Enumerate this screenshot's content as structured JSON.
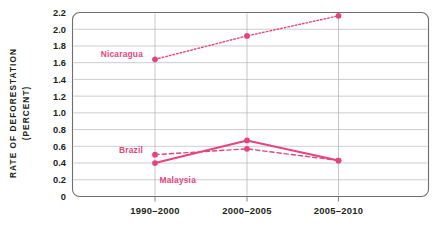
{
  "chart_data": {
    "type": "line",
    "title": "",
    "xlabel": "",
    "ylabel_line1": "RATE OF DEFORESTATION",
    "ylabel_line2": "(PERCENT)",
    "categories": [
      "1990–2000",
      "2000–2005",
      "2005–2010"
    ],
    "ylim": [
      0,
      2.2
    ],
    "ytick_values": [
      0,
      0.2,
      0.4,
      0.6,
      0.8,
      1.0,
      1.2,
      1.4,
      1.6,
      1.8,
      2.0,
      2.2
    ],
    "ytick_labels": [
      "0",
      "0.2",
      "0.4",
      "0.6",
      "0.8",
      "1.0",
      "1.2",
      "1.4",
      "1.6",
      "1.8",
      "2.0",
      "2.2"
    ],
    "grid": true,
    "legend_position": "inline-annotations",
    "series": [
      {
        "name": "Nicaragua",
        "values": [
          1.64,
          1.92,
          2.16
        ],
        "style": "dotted",
        "color": "#e5457f",
        "label_x_value": 0.62,
        "label_y_value": 1.7
      },
      {
        "name": "Brazil",
        "values": [
          0.5,
          0.57,
          0.43
        ],
        "style": "dashed",
        "color": "#e5457f",
        "label_x_value": 0.6,
        "label_y_value": 0.52
      },
      {
        "name": "Malaysia",
        "values": [
          0.4,
          0.67,
          0.43
        ],
        "style": "solid",
        "color": "#e5457f",
        "label_x_value": 0.78,
        "label_y_value": 0.29
      }
    ]
  },
  "colors": {
    "accent": "#e5457f",
    "grid": "#b9bcbf",
    "axis": "#6d6e71",
    "text": "#231f20",
    "background": "#ffffff"
  }
}
